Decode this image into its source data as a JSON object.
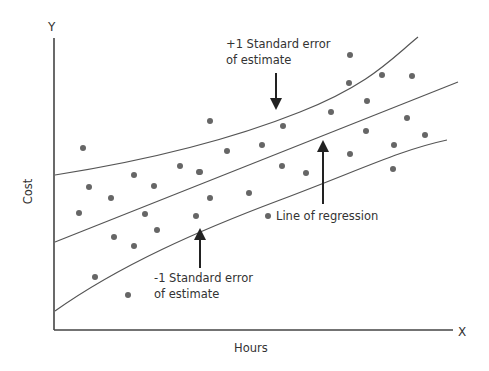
{
  "chart_data": {
    "type": "scatter",
    "title": "",
    "xlabel": "Hours",
    "ylabel": "Cost",
    "x_axis_end_label": "X",
    "y_axis_end_label": "Y",
    "grid": false,
    "legend": null,
    "axes_pixel": {
      "origin": [
        54,
        330
      ],
      "x_end": [
        453,
        330
      ],
      "y_end": [
        54,
        38
      ]
    },
    "points_pixel": [
      [
        83,
        148
      ],
      [
        89,
        187
      ],
      [
        111,
        198
      ],
      [
        134,
        175
      ],
      [
        154,
        186
      ],
      [
        180,
        166
      ],
      [
        199,
        172
      ],
      [
        79,
        213
      ],
      [
        145,
        214
      ],
      [
        114,
        237
      ],
      [
        134,
        246
      ],
      [
        157,
        230
      ],
      [
        95,
        277
      ],
      [
        128,
        295
      ],
      [
        196,
        216
      ],
      [
        210,
        121
      ],
      [
        283,
        126
      ],
      [
        331,
        112
      ],
      [
        227,
        151
      ],
      [
        262,
        145
      ],
      [
        200,
        172
      ],
      [
        282,
        166
      ],
      [
        306,
        173
      ],
      [
        210,
        198
      ],
      [
        249,
        193
      ],
      [
        268,
        216
      ],
      [
        350,
        55
      ],
      [
        349,
        83
      ],
      [
        382,
        75
      ],
      [
        412,
        76
      ],
      [
        367,
        101
      ],
      [
        407,
        118
      ],
      [
        366,
        131
      ],
      [
        425,
        135
      ],
      [
        394,
        145
      ],
      [
        350,
        154
      ],
      [
        393,
        169
      ]
    ],
    "series": [
      {
        "name": "+1 Standard error of estimate",
        "kind": "curve",
        "path": "M55,175 C150,160 230,140 300,112 S390,60 418,37"
      },
      {
        "name": "Line of regression",
        "kind": "line",
        "path": "M55,242 L458,82"
      },
      {
        "name": "-1 Standard error of estimate",
        "kind": "curve",
        "path": "M55,311 C120,265 200,230 280,200 S400,150 447,140"
      }
    ],
    "annotations": [
      {
        "text_line1": "+1 Standard error",
        "text_line2": "of estimate",
        "arrow": "down",
        "target": "upper band"
      },
      {
        "text_line1": "Line of regression",
        "arrow": "up",
        "target": "regression line"
      },
      {
        "text_line1": "-1 Standard error",
        "text_line2": "of estimate",
        "arrow": "up",
        "target": "lower band"
      }
    ]
  },
  "labels": {
    "y_axis": "Y",
    "x_axis": "X",
    "y_title": "Cost",
    "x_title": "Hours",
    "upper_1": "+1 Standard error",
    "upper_2": "of estimate",
    "regression": "Line of regression",
    "lower_1": "-1 Standard error",
    "lower_2": "of estimate"
  },
  "colors": {
    "axis": "#444444",
    "line": "#555555",
    "dot": "#666666",
    "text": "#333333"
  }
}
